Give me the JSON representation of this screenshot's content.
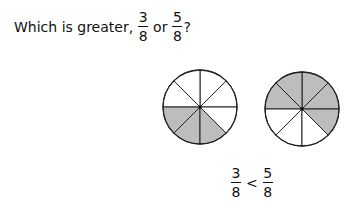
{
  "question": {
    "prefix": "Which is greater,",
    "frac1": {
      "num": "3",
      "den": "8"
    },
    "connector": "or",
    "frac2": {
      "num": "5",
      "den": "8"
    },
    "suffix": "?"
  },
  "pies": [
    {
      "label": "3/8",
      "slices": 8,
      "shaded": 3,
      "cx": 200,
      "cy": 107,
      "r": 37,
      "shaded_sectors": [
        4,
        5,
        6
      ]
    },
    {
      "label": "5/8",
      "slices": 8,
      "shaded": 5,
      "cx": 302,
      "cy": 109,
      "r": 37,
      "shaded_sectors": [
        0,
        1,
        2,
        3,
        7
      ]
    }
  ],
  "colors": {
    "shade": "#bdbdbd",
    "stroke": "#222222"
  },
  "answer": {
    "left": {
      "num": "3",
      "den": "8"
    },
    "operator": "<",
    "right": {
      "num": "5",
      "den": "8"
    }
  }
}
